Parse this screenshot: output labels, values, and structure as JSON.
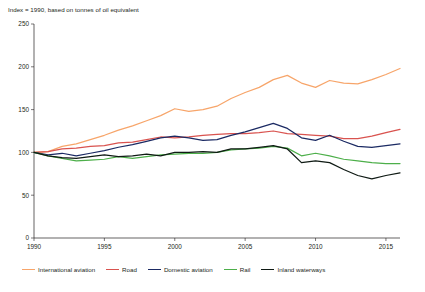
{
  "chart_data": {
    "type": "line",
    "title": "",
    "subtitle": "Index = 1990, based on tonnes of oil equivalent",
    "xlabel": "",
    "ylabel": "",
    "xlim": [
      1990,
      2016
    ],
    "ylim": [
      0,
      250
    ],
    "yticks": [
      0,
      50,
      100,
      150,
      200,
      250
    ],
    "xticks": [
      1990,
      1995,
      2000,
      2005,
      2010,
      2015
    ],
    "grid": false,
    "legend_position": "bottom",
    "x": [
      1990,
      1991,
      1992,
      1993,
      1994,
      1995,
      1996,
      1997,
      1998,
      1999,
      2000,
      2001,
      2002,
      2003,
      2004,
      2005,
      2006,
      2007,
      2008,
      2009,
      2010,
      2011,
      2012,
      2013,
      2014,
      2015,
      2016
    ],
    "series": [
      {
        "name": "International aviation",
        "color": "#f7a56a",
        "values": [
          100,
          101,
          107,
          110,
          115,
          120,
          126,
          131,
          137,
          143,
          151,
          148,
          150,
          154,
          163,
          170,
          176,
          185,
          190,
          181,
          176,
          184,
          181,
          180,
          185,
          191,
          198
        ]
      },
      {
        "name": "Road",
        "color": "#d9534f",
        "values": [
          100,
          101,
          104,
          105,
          107,
          108,
          111,
          112,
          115,
          118,
          117,
          118,
          120,
          121,
          122,
          122,
          123,
          125,
          122,
          121,
          120,
          119,
          116,
          116,
          119,
          123,
          127
        ]
      },
      {
        "name": "Domestic aviation",
        "color": "#1b2a63",
        "values": [
          100,
          97,
          99,
          96,
          99,
          102,
          106,
          109,
          113,
          117,
          119,
          117,
          114,
          115,
          120,
          124,
          129,
          134,
          128,
          117,
          114,
          120,
          113,
          107,
          106,
          108,
          110
        ]
      },
      {
        "name": "Rail",
        "color": "#4daf4a",
        "values": [
          100,
          96,
          93,
          90,
          91,
          92,
          95,
          93,
          95,
          97,
          98,
          99,
          99,
          100,
          103,
          104,
          105,
          107,
          105,
          96,
          99,
          96,
          92,
          90,
          88,
          87,
          87
        ]
      },
      {
        "name": "Inland waterways",
        "color": "#0f1a14",
        "values": [
          100,
          96,
          94,
          93,
          95,
          97,
          95,
          96,
          98,
          96,
          100,
          100,
          101,
          100,
          104,
          104,
          106,
          108,
          104,
          88,
          90,
          88,
          80,
          73,
          69,
          73,
          76
        ]
      }
    ]
  },
  "footer": {
    "text": ""
  }
}
